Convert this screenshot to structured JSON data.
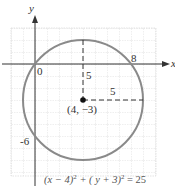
{
  "diagram": {
    "type": "circle-graph",
    "axes": {
      "x_label": "x",
      "y_label": "y",
      "origin_label": "0"
    },
    "circle": {
      "center": [
        4,
        -3
      ],
      "radius": 5,
      "color": "#8a8a8a"
    },
    "labels": {
      "x_intercept": "8",
      "y_intercept": "-6",
      "vertical_radius": "5",
      "horizontal_radius": "5",
      "center": "(4, −3)"
    },
    "equation": {
      "part1": "(x − 4)",
      "exp1": "2",
      "part2": " + ( y + 3)",
      "exp2": "2",
      "part3": " = 25"
    },
    "colors": {
      "grid": "#d6d6d6",
      "axis": "#333333",
      "curve": "#8a8a8a",
      "text": "#333333"
    }
  }
}
